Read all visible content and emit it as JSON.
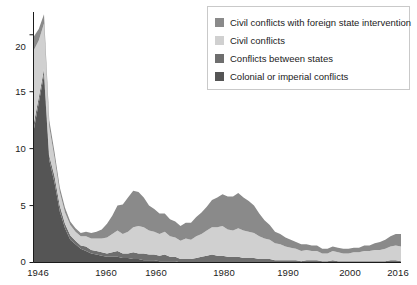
{
  "chart_data": {
    "type": "area",
    "stacked": true,
    "title": "",
    "xlabel": "",
    "ylabel": "",
    "xlim": [
      1946,
      2016
    ],
    "ylim": [
      0,
      22
    ],
    "yticks": [
      0,
      5,
      10,
      15,
      20
    ],
    "ytick_labels": [
      "0",
      "5",
      "10",
      "15",
      "20"
    ],
    "xticks": [
      1946,
      1960,
      1960,
      1980,
      1990,
      2000,
      2016
    ],
    "xtick_labels": [
      "1946",
      "1960",
      "1960",
      "1980",
      "1990",
      "2000",
      "2016"
    ],
    "grid": false,
    "legend_position": "top-right",
    "colors": {
      "civil_foreign": "#8a8a8a",
      "civil": "#d0d0d0",
      "interstate": "#6e6e6e",
      "colonial": "#555555",
      "axis": "#1b1b1b",
      "legend_border": "#c9c9c9",
      "background": "#ffffff"
    },
    "x": [
      1946,
      1947,
      1948,
      1949,
      1950,
      1951,
      1952,
      1953,
      1954,
      1955,
      1956,
      1957,
      1958,
      1959,
      1960,
      1961,
      1962,
      1963,
      1964,
      1965,
      1966,
      1967,
      1968,
      1969,
      1970,
      1971,
      1972,
      1973,
      1974,
      1975,
      1976,
      1977,
      1978,
      1979,
      1980,
      1981,
      1982,
      1983,
      1984,
      1985,
      1986,
      1987,
      1988,
      1989,
      1990,
      1991,
      1992,
      1993,
      1994,
      1995,
      1996,
      1997,
      1998,
      1999,
      2000,
      2001,
      2002,
      2003,
      2004,
      2005,
      2006,
      2007,
      2008,
      2009,
      2010,
      2011,
      2012,
      2013,
      2014,
      2015,
      2016
    ],
    "series": [
      {
        "name": "Colonial or imperial conflicts",
        "order": 1,
        "values": [
          11.5,
          14.0,
          16.5,
          9.0,
          7.0,
          4.5,
          3.0,
          2.0,
          1.6,
          1.2,
          1.0,
          0.8,
          0.7,
          0.6,
          0.5,
          0.5,
          0.5,
          0.4,
          0.4,
          0.3,
          0.3,
          0.2,
          0.2,
          0.2,
          0.1,
          0.1,
          0.1,
          0.1,
          0.0,
          0.0,
          0.0,
          0.0,
          0.0,
          0.0,
          0.0,
          0.0,
          0.0,
          0.0,
          0.0,
          0.0,
          0.0,
          0.0,
          0.0,
          0.0,
          0.0,
          0.0,
          0.0,
          0.0,
          0.0,
          0.0,
          0.0,
          0.0,
          0.0,
          0.0,
          0.0,
          0.0,
          0.0,
          0.0,
          0.0,
          0.0,
          0.0,
          0.0,
          0.0,
          0.0,
          0.0,
          0.0,
          0.0,
          0.0,
          0.0,
          0.0,
          0.0
        ]
      },
      {
        "name": "Conflicts between states",
        "order": 2,
        "values": [
          0.6,
          0.5,
          0.5,
          0.4,
          0.6,
          0.5,
          0.4,
          0.4,
          0.3,
          0.3,
          0.4,
          0.3,
          0.3,
          0.3,
          0.3,
          0.4,
          0.5,
          0.4,
          0.4,
          0.6,
          0.5,
          0.6,
          0.5,
          0.5,
          0.5,
          0.6,
          0.4,
          0.4,
          0.3,
          0.3,
          0.3,
          0.4,
          0.5,
          0.6,
          0.7,
          0.6,
          0.6,
          0.5,
          0.5,
          0.5,
          0.4,
          0.4,
          0.4,
          0.3,
          0.3,
          0.3,
          0.2,
          0.2,
          0.2,
          0.2,
          0.2,
          0.1,
          0.2,
          0.2,
          0.2,
          0.1,
          0.1,
          0.2,
          0.1,
          0.1,
          0.1,
          0.1,
          0.1,
          0.1,
          0.1,
          0.1,
          0.1,
          0.1,
          0.2,
          0.2,
          0.1
        ]
      },
      {
        "name": "Civil conflicts",
        "order": 3,
        "values": [
          6.5,
          5.0,
          4.0,
          2.5,
          1.6,
          1.2,
          1.0,
          0.9,
          0.8,
          0.8,
          0.9,
          1.0,
          1.1,
          1.2,
          1.4,
          1.6,
          1.8,
          1.7,
          1.9,
          2.2,
          2.4,
          2.3,
          2.1,
          2.0,
          1.9,
          2.0,
          1.8,
          1.7,
          1.6,
          1.8,
          1.7,
          1.9,
          2.0,
          2.2,
          2.4,
          2.5,
          2.6,
          2.4,
          2.3,
          2.5,
          2.4,
          2.3,
          2.2,
          2.0,
          1.8,
          1.7,
          1.5,
          1.4,
          1.2,
          1.1,
          1.0,
          0.9,
          0.9,
          0.8,
          0.8,
          0.7,
          0.7,
          0.8,
          0.8,
          0.7,
          0.7,
          0.8,
          0.8,
          0.9,
          0.9,
          1.0,
          1.0,
          1.1,
          1.2,
          1.3,
          1.3
        ]
      },
      {
        "name": "Civil conflicts with foreign state intervention",
        "order": 4,
        "values": [
          1.2,
          1.0,
          0.8,
          0.6,
          0.5,
          0.4,
          0.4,
          0.3,
          0.3,
          0.3,
          0.4,
          0.5,
          0.6,
          0.8,
          1.2,
          1.6,
          2.2,
          2.6,
          3.0,
          3.2,
          3.0,
          2.6,
          2.2,
          2.0,
          1.8,
          1.6,
          1.5,
          1.4,
          1.3,
          1.4,
          1.5,
          1.7,
          1.9,
          2.1,
          2.4,
          2.6,
          2.8,
          2.9,
          3.0,
          3.1,
          2.9,
          2.7,
          2.4,
          2.0,
          1.6,
          1.3,
          1.0,
          0.9,
          0.8,
          0.7,
          0.6,
          0.6,
          0.5,
          0.5,
          0.5,
          0.4,
          0.4,
          0.4,
          0.4,
          0.4,
          0.4,
          0.4,
          0.4,
          0.5,
          0.5,
          0.6,
          0.7,
          0.8,
          0.9,
          1.0,
          1.1
        ]
      }
    ]
  },
  "legend": {
    "items": [
      {
        "label": "Civil conflicts with foreign state intervention",
        "color": "#8a8a8a"
      },
      {
        "label": "Civil conflicts",
        "color": "#d0d0d0"
      },
      {
        "label": "Conflicts between states",
        "color": "#6e6e6e"
      },
      {
        "label": "Colonial or imperial conflicts",
        "color": "#555555"
      }
    ]
  },
  "axes": {
    "y_labels": [
      "20",
      "15",
      "10",
      "5",
      "0"
    ],
    "x_labels": [
      "1946",
      "1960",
      "1960",
      "1980",
      "1990",
      "2000",
      "2016"
    ]
  }
}
